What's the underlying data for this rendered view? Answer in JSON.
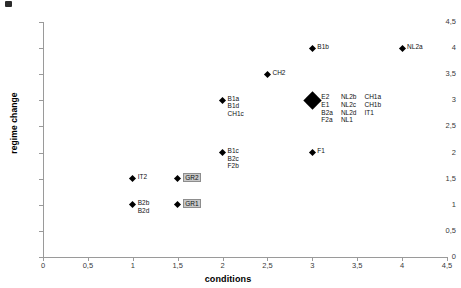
{
  "chart_data": {
    "type": "scatter",
    "title": "",
    "xlabel": "conditions",
    "ylabel": "regime change",
    "xlim": [
      0,
      4.5
    ],
    "ylim": [
      0,
      4.5
    ],
    "xticks": [
      "0",
      "0,5",
      "1",
      "1,5",
      "2",
      "2,5",
      "3",
      "3,5",
      "4",
      "4,5"
    ],
    "yticks": [
      "0",
      "0,5",
      "1",
      "1,5",
      "2",
      "2,5",
      "3",
      "3,5",
      "4",
      "4,5"
    ],
    "grid": false,
    "legend": "none",
    "marker": "diamond",
    "marker_color": "#000000",
    "highlight_color": "#c9c9c9",
    "points": [
      {
        "id": "pt-b2",
        "x": 1,
        "y": 1,
        "size": "small",
        "label_columns": [
          {
            "items": [
              {
                "text": "B2b",
                "boxed": false
              },
              {
                "text": "B2d",
                "boxed": false
              }
            ]
          }
        ]
      },
      {
        "id": "pt-gr1",
        "x": 1.5,
        "y": 1,
        "size": "small",
        "label_columns": [
          {
            "items": [
              {
                "text": "GR1",
                "boxed": true
              }
            ]
          }
        ]
      },
      {
        "id": "pt-it2",
        "x": 1,
        "y": 1.5,
        "size": "small",
        "label_columns": [
          {
            "items": [
              {
                "text": "IT2",
                "boxed": false
              }
            ]
          }
        ]
      },
      {
        "id": "pt-gr2",
        "x": 1.5,
        "y": 1.5,
        "size": "small",
        "label_columns": [
          {
            "items": [
              {
                "text": "GR2",
                "boxed": true
              }
            ]
          }
        ]
      },
      {
        "id": "pt-b1c",
        "x": 2,
        "y": 2,
        "size": "small",
        "label_columns": [
          {
            "items": [
              {
                "text": "B1c",
                "boxed": false
              },
              {
                "text": "B2c",
                "boxed": false
              },
              {
                "text": "F2b",
                "boxed": false
              }
            ]
          }
        ]
      },
      {
        "id": "pt-b1a",
        "x": 2,
        "y": 3,
        "size": "small",
        "label_columns": [
          {
            "items": [
              {
                "text": "B1a",
                "boxed": false
              },
              {
                "text": "B1d",
                "boxed": false
              },
              {
                "text": "CH1c",
                "boxed": false
              }
            ]
          }
        ]
      },
      {
        "id": "pt-ch2",
        "x": 2.5,
        "y": 3.5,
        "size": "small",
        "label_columns": [
          {
            "items": [
              {
                "text": "CH2",
                "boxed": false
              }
            ]
          }
        ]
      },
      {
        "id": "pt-f1",
        "x": 3,
        "y": 2,
        "size": "small",
        "label_columns": [
          {
            "items": [
              {
                "text": "F1",
                "boxed": false
              }
            ]
          }
        ]
      },
      {
        "id": "pt-cluster",
        "x": 3,
        "y": 3,
        "size": "large",
        "label_columns": [
          {
            "items": [
              {
                "text": "E2",
                "boxed": false
              },
              {
                "text": "E1",
                "boxed": false
              },
              {
                "text": "B2a",
                "boxed": false
              },
              {
                "text": "F2a",
                "boxed": false
              }
            ]
          },
          {
            "items": [
              {
                "text": "NL2b",
                "boxed": false
              },
              {
                "text": "NL2c",
                "boxed": false
              },
              {
                "text": "NL2d",
                "boxed": false
              },
              {
                "text": "NL1",
                "boxed": false
              }
            ]
          },
          {
            "items": [
              {
                "text": "CH1a",
                "boxed": false
              },
              {
                "text": "CH1b",
                "boxed": false
              },
              {
                "text": "IT1",
                "boxed": false
              }
            ]
          }
        ]
      },
      {
        "id": "pt-b1b",
        "x": 3,
        "y": 4,
        "size": "small",
        "label_columns": [
          {
            "items": [
              {
                "text": "B1b",
                "boxed": false
              }
            ]
          }
        ]
      },
      {
        "id": "pt-nl2a",
        "x": 4,
        "y": 4,
        "size": "small",
        "label_columns": [
          {
            "items": [
              {
                "text": "NL2a",
                "boxed": false
              }
            ]
          }
        ]
      }
    ]
  }
}
